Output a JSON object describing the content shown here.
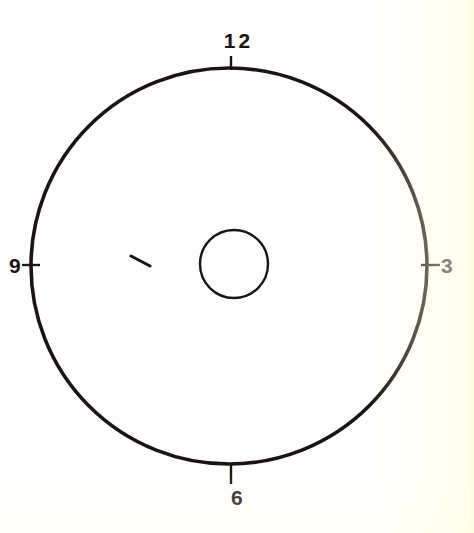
{
  "figure": {
    "name": "clock-face-diagram",
    "background_color": "#ffffff",
    "ink_color": "#1a1512",
    "geometry": {
      "dial": {
        "center_x": 229,
        "center_y": 266,
        "radius": 198,
        "stroke_width": 3.6
      },
      "hub": {
        "center_x": 234,
        "center_y": 264,
        "radius": 34,
        "stroke_width": 2.4
      },
      "tick_length": 12,
      "tick_width": 2.4
    }
  },
  "dial": {
    "name": "clock-dial",
    "hour_markers": [
      {
        "hour": "12",
        "position": "top",
        "angle_deg": 0,
        "tick": true
      },
      {
        "hour": "3",
        "position": "right",
        "angle_deg": 90,
        "tick": true
      },
      {
        "hour": "6",
        "position": "bottom",
        "angle_deg": 180,
        "tick": true
      },
      {
        "hour": "9",
        "position": "left",
        "angle_deg": 270,
        "tick": true
      }
    ]
  },
  "labels": {
    "twelve": "12",
    "three": "3",
    "six": "6",
    "nine": "9"
  },
  "hand": {
    "name": "clock-hand-fragment",
    "description": "short diagonal stroke left of the hub",
    "x1": 131,
    "y1": 256,
    "x2": 150,
    "y2": 266,
    "stroke_width": 3
  }
}
